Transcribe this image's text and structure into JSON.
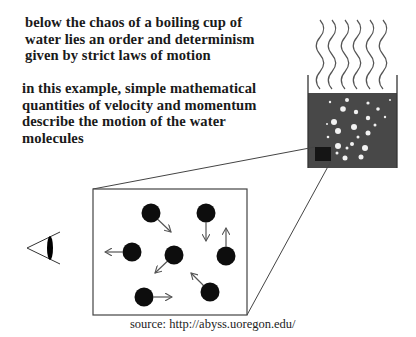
{
  "text": {
    "paragraph1": [
      "below the chaos of a boiling cup of",
      "water lies an order and determinism",
      "given by strict laws of motion"
    ],
    "paragraph2": [
      "in this example, simple mathematical",
      "quantities of velocity and momentum",
      "describe the motion of the water",
      "molecules"
    ],
    "source": "source: http://abyss.uoregon.edu/"
  },
  "colors": {
    "water": "#484848",
    "zoom_square": "#151515",
    "molecule": "#0d0d0d",
    "arrow": "#555555",
    "line": "#444444",
    "steam": "#555555",
    "bubble": "#f2f2f2"
  },
  "cup": {
    "left": 308,
    "right": 397,
    "wall_top": 75,
    "water_top": 93,
    "bottom": 168,
    "zoom_square": {
      "x": 315,
      "y": 147,
      "w": 16,
      "h": 14
    },
    "steam_x": [
      320,
      332,
      345,
      357,
      370,
      383
    ],
    "steam_top": 20,
    "steam_bottom": 89,
    "bubbles": [
      [
        347,
        100,
        2
      ],
      [
        330,
        102,
        1.2
      ],
      [
        368,
        103,
        1.6
      ],
      [
        343,
        109,
        2.8
      ],
      [
        378,
        109,
        1.8
      ],
      [
        356,
        112,
        2.2
      ],
      [
        334,
        122,
        3
      ],
      [
        368,
        118,
        2.2
      ],
      [
        375,
        125,
        1.5
      ],
      [
        354,
        127,
        3
      ],
      [
        338,
        131,
        3
      ],
      [
        368,
        133,
        2.5
      ],
      [
        358,
        137,
        1.5
      ],
      [
        328,
        137,
        1.3
      ],
      [
        338,
        146,
        3
      ],
      [
        352,
        144,
        2
      ],
      [
        365,
        148,
        3
      ],
      [
        347,
        148,
        1.5
      ],
      [
        337,
        153,
        1.5
      ],
      [
        345,
        158,
        2.5
      ],
      [
        361,
        157,
        2.5
      ],
      [
        327,
        124,
        1
      ],
      [
        385,
        117,
        1.2
      ],
      [
        390,
        100,
        1
      ]
    ]
  },
  "zoom_box": {
    "x": 93,
    "y": 189,
    "w": 154,
    "h": 126,
    "molecule_radius": 9.5,
    "molecules": [
      {
        "cx": 151,
        "cy": 213,
        "ax": 171,
        "ay": 232
      },
      {
        "cx": 206,
        "cy": 213,
        "ax": 206,
        "ay": 241
      },
      {
        "cx": 132,
        "cy": 252,
        "ax": 105,
        "ay": 252
      },
      {
        "cx": 174,
        "cy": 255,
        "ax": 155,
        "ay": 273
      },
      {
        "cx": 226,
        "cy": 256,
        "ax": 226,
        "ay": 228
      },
      {
        "cx": 210,
        "cy": 292,
        "ax": 191,
        "ay": 273
      },
      {
        "cx": 144,
        "cy": 297,
        "ax": 172,
        "ay": 297
      }
    ]
  },
  "eye": {
    "apex_x": 27,
    "apex_y": 248,
    "end_x": 60,
    "top_y": 232,
    "bottom_y": 264,
    "lens_cx": 50,
    "lens_cy": 248,
    "lens_rx": 3,
    "lens_ry": 12
  }
}
